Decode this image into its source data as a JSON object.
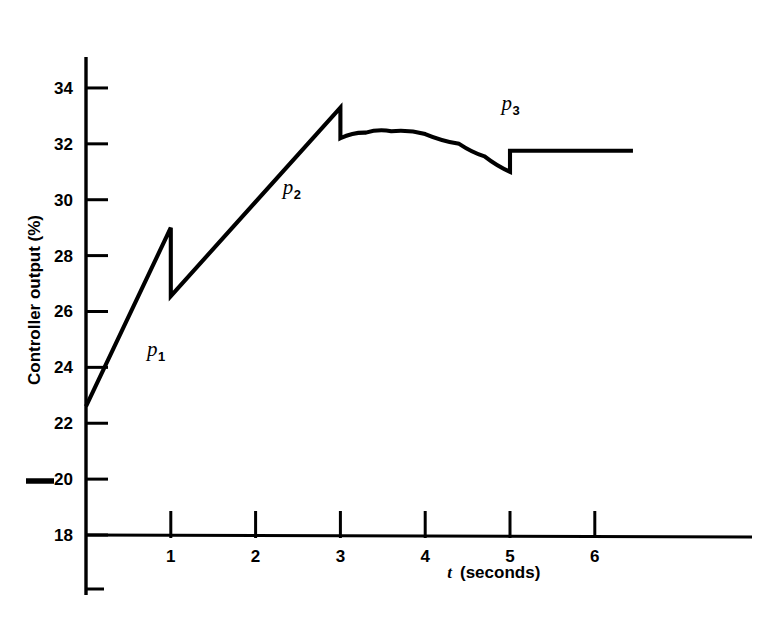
{
  "chart_data": {
    "type": "line",
    "title": "",
    "xlabel": "t (seconds)",
    "ylabel": "Controller output (%)",
    "xlabel_symbol": "t",
    "xlabel_unit": "(seconds)",
    "xlim": [
      0,
      6.45
    ],
    "ylim": [
      17.3,
      35.1
    ],
    "grid": false,
    "legend": "none",
    "x_ticks": [
      1,
      2,
      3,
      4,
      5,
      6
    ],
    "x_tick_labels": [
      "1",
      "2",
      "3",
      "4",
      "5",
      "6"
    ],
    "y_ticks": [
      18,
      20,
      22,
      24,
      26,
      28,
      30,
      32,
      34
    ],
    "y_tick_labels": [
      "18",
      "20",
      "22",
      "24",
      "26",
      "28",
      "30",
      "32",
      "34"
    ],
    "line_color": "#000000",
    "axis_color": "#000000",
    "background_color": "#ffffff",
    "series": [
      {
        "name": "Controller output",
        "description": "Piecewise PID controller output with two step discontinuities",
        "points": [
          {
            "t": 0.0,
            "p": 22.6
          },
          {
            "t": 1.0,
            "p": 29.0
          },
          {
            "t": 1.0,
            "p": 26.55
          },
          {
            "t": 3.0,
            "p": 33.3
          },
          {
            "t": 3.0,
            "p": 32.2
          },
          {
            "t": 3.3,
            "p": 32.4
          },
          {
            "t": 3.6,
            "p": 32.45
          },
          {
            "t": 4.0,
            "p": 32.35
          },
          {
            "t": 4.4,
            "p": 32.0
          },
          {
            "t": 4.7,
            "p": 31.55
          },
          {
            "t": 5.0,
            "p": 31.0
          },
          {
            "t": 5.0,
            "p": 31.75
          },
          {
            "t": 6.45,
            "p": 31.75
          }
        ]
      }
    ],
    "annotations": [
      {
        "name": "p1",
        "base": "p",
        "sub": "1",
        "t": 0.72,
        "p": 24.4
      },
      {
        "name": "p2",
        "base": "p",
        "sub": "2",
        "t": 2.32,
        "p": 30.2
      },
      {
        "name": "p3",
        "base": "p",
        "sub": "3",
        "t": 4.9,
        "p": 33.2
      }
    ],
    "marks": [
      {
        "name": "reference-dash-at-20",
        "value": 20,
        "description": "thick horizontal rule left of the 20 tick label"
      }
    ]
  }
}
